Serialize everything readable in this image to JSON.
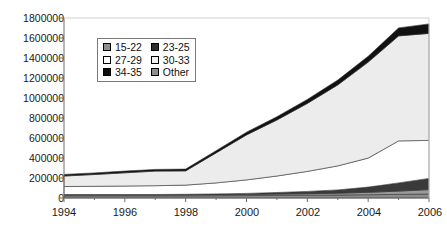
{
  "chart_data": {
    "type": "area",
    "stacked": true,
    "title": "",
    "subtitle": "",
    "xlabel": "",
    "ylabel": "",
    "x": [
      1994,
      1995,
      1996,
      1997,
      1998,
      1999,
      2000,
      2001,
      2002,
      2003,
      2004,
      2005,
      2006
    ],
    "tick_labels_x": [
      "1994",
      "1996",
      "1998",
      "2000",
      "2002",
      "2004",
      "2006"
    ],
    "tick_labels_y": [
      "0",
      "200000",
      "400000",
      "600000",
      "800000",
      "1000000",
      "1200000",
      "1400000",
      "1600000",
      "1800000"
    ],
    "xlim": [
      1994,
      2006
    ],
    "ylim": [
      0,
      1800000
    ],
    "ytick_step": 200000,
    "xtick_step": 2,
    "grid": false,
    "legend_position": "inside-upper-left",
    "stack_order_bottom_to_top": [
      "Other",
      "15-22",
      "23-25",
      "30-33",
      "27-29",
      "34-35"
    ],
    "series": [
      {
        "name": "Other",
        "color": "#8c8c8c",
        "values": [
          22000,
          22000,
          22000,
          22000,
          22000,
          23000,
          24000,
          26000,
          28000,
          30000,
          33000,
          36000,
          40000
        ]
      },
      {
        "name": "15-22",
        "color": "#9a9a9a",
        "values": [
          8000,
          8000,
          8000,
          8000,
          9000,
          10000,
          11000,
          13000,
          15000,
          18000,
          24000,
          33000,
          44000
        ]
      },
      {
        "name": "23-25",
        "color": "#3a3a3a",
        "values": [
          5000,
          5000,
          5000,
          5000,
          6000,
          8000,
          11000,
          16000,
          23000,
          33000,
          52000,
          82000,
          112000
        ]
      },
      {
        "name": "30-33",
        "color": "#ffffff",
        "values": [
          80000,
          82000,
          85000,
          88000,
          92000,
          110000,
          135000,
          165000,
          200000,
          240000,
          290000,
          420000,
          380000
        ]
      },
      {
        "name": "27-29",
        "color": "#ececec",
        "values": [
          105000,
          118000,
          132000,
          146000,
          142000,
          300000,
          450000,
          560000,
          680000,
          810000,
          960000,
          1050000,
          1070000
        ]
      },
      {
        "name": "34-35",
        "color": "#111111",
        "values": [
          16000,
          16000,
          17000,
          17000,
          18000,
          22000,
          27000,
          33000,
          40000,
          48000,
          58000,
          80000,
          95000
        ]
      }
    ],
    "totals": [
      236000,
      251000,
      269000,
      286000,
      289000,
      473000,
      658000,
      813000,
      986000,
      1179000,
      1417000,
      1701000,
      1741000
    ],
    "legend": {
      "entries": [
        {
          "label": "15-22",
          "swatch": "#8e8e8e"
        },
        {
          "label": "23-25",
          "swatch": "#2e2e2e"
        },
        {
          "label": "27-29",
          "swatch": "#ffffff"
        },
        {
          "label": "30-33",
          "swatch": "#f2f2f2"
        },
        {
          "label": "34-35",
          "swatch": "#0d0d0d"
        },
        {
          "label": "Other",
          "swatch": "#8e8e8e"
        }
      ]
    }
  },
  "axis": {
    "y_ticks": [
      {
        "label": "1800000",
        "value": 1800000
      },
      {
        "label": "1600000",
        "value": 1600000
      },
      {
        "label": "1400000",
        "value": 1400000
      },
      {
        "label": "1200000",
        "value": 1200000
      },
      {
        "label": "1000000",
        "value": 1000000
      },
      {
        "label": "800000",
        "value": 800000
      },
      {
        "label": "600000",
        "value": 600000
      },
      {
        "label": "400000",
        "value": 400000
      },
      {
        "label": "200000",
        "value": 200000
      },
      {
        "label": "0",
        "value": 0
      }
    ],
    "x_ticks": [
      {
        "label": "1994",
        "value": 1994
      },
      {
        "label": "1996",
        "value": 1996
      },
      {
        "label": "1998",
        "value": 1998
      },
      {
        "label": "2000",
        "value": 2000
      },
      {
        "label": "2002",
        "value": 2002
      },
      {
        "label": "2004",
        "value": 2004
      },
      {
        "label": "2006",
        "value": 2006
      }
    ]
  },
  "colors": {
    "frame": "#6f6f6f",
    "background": "#ffffff",
    "text": "#1a1a1a"
  }
}
